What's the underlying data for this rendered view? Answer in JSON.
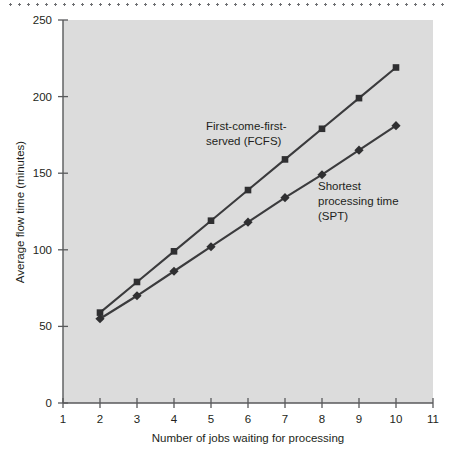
{
  "chart_data": {
    "type": "line",
    "title": "",
    "xlabel": "Number of jobs waiting for processing",
    "ylabel": "Average flow time (minutes)",
    "x": [
      2,
      3,
      4,
      5,
      6,
      7,
      8,
      9,
      10
    ],
    "xlim": [
      1,
      11
    ],
    "ylim": [
      0,
      250
    ],
    "xticks": [
      "1",
      "2",
      "3",
      "4",
      "5",
      "6",
      "7",
      "8",
      "9",
      "10",
      "11"
    ],
    "yticks": [
      "0",
      "50",
      "100",
      "150",
      "200",
      "250"
    ],
    "grid": false,
    "legend_position": "inline-annotation",
    "plot_background": "#dcdcdc",
    "series": [
      {
        "name": "First-come-first-served (FCFS)",
        "marker": "square",
        "color": "#3b3b3d",
        "values": [
          59,
          79,
          99,
          119,
          139,
          159,
          179,
          199,
          219
        ]
      },
      {
        "name": "Shortest processing time (SPT)",
        "marker": "diamond",
        "color": "#3b3b3d",
        "values": [
          55,
          70,
          86,
          102,
          118,
          134,
          149,
          165,
          181
        ]
      }
    ],
    "annotations": [
      {
        "id": "fcfs",
        "lines": [
          "First-come-first-",
          "served (FCFS)"
        ],
        "x_px": 206,
        "y_px": 130
      },
      {
        "id": "spt",
        "lines": [
          "Shortest",
          "processing time",
          "(SPT)"
        ],
        "x_px": 318,
        "y_px": 190
      }
    ]
  },
  "axis": {
    "y_title": "Average flow time (minutes)",
    "x_title": "Number of jobs waiting for processing"
  },
  "decoration": {
    "top_rule": "dotted-divider"
  }
}
